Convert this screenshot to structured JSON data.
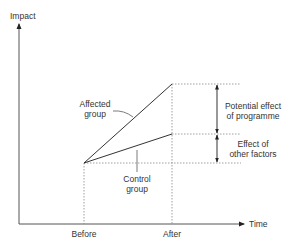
{
  "diagram": {
    "y_axis_label": "Impact",
    "x_axis_label": "Time",
    "x_ticks": [
      "Before",
      "After"
    ],
    "series": [
      {
        "name": "Affected group",
        "label_lines": [
          "Affected",
          "group"
        ]
      },
      {
        "name": "Control group",
        "label_lines": [
          "Control",
          "group"
        ]
      }
    ],
    "annotations": [
      {
        "name": "Potential effect of programme",
        "label_lines": [
          "Potential effect",
          "of programme"
        ]
      },
      {
        "name": "Effect of other factors",
        "label_lines": [
          "Effect of",
          "other factors"
        ]
      }
    ],
    "colors": {
      "line": "#333333",
      "dotted": "#888888",
      "text": "#333333"
    }
  }
}
